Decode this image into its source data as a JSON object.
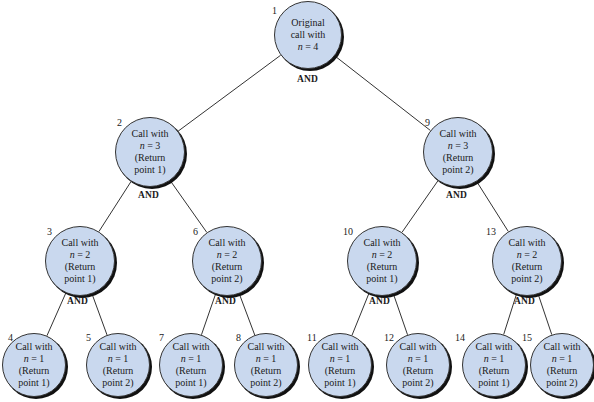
{
  "diagram": {
    "type": "recursion-tree",
    "and_label": "AND",
    "nodes": [
      {
        "id": 1,
        "lines": [
          "Original",
          "call with",
          "n = 4"
        ],
        "cx": 308,
        "cy": 35,
        "r": 34,
        "num_x": 272,
        "num_y": 5,
        "parent": null
      },
      {
        "id": 2,
        "lines": [
          "Call with",
          "n = 3",
          "(Return",
          "point 1)"
        ],
        "cx": 150,
        "cy": 152,
        "r": 35,
        "num_x": 117,
        "num_y": 117,
        "parent": 1
      },
      {
        "id": 9,
        "lines": [
          "Call with",
          "n = 3",
          "(Return",
          "point 2)"
        ],
        "cx": 458,
        "cy": 152,
        "r": 35,
        "num_x": 425,
        "num_y": 117,
        "parent": 1
      },
      {
        "id": 3,
        "lines": [
          "Call with",
          "n = 2",
          "(Return",
          "point 1)"
        ],
        "cx": 80,
        "cy": 261,
        "r": 35,
        "num_x": 47,
        "num_y": 226,
        "parent": 2
      },
      {
        "id": 6,
        "lines": [
          "Call with",
          "n = 2",
          "(Return",
          "point 2)"
        ],
        "cx": 227,
        "cy": 261,
        "r": 35,
        "num_x": 193,
        "num_y": 226,
        "parent": 2
      },
      {
        "id": 10,
        "lines": [
          "Call with",
          "n = 2",
          "(Return",
          "point 1)"
        ],
        "cx": 382,
        "cy": 261,
        "r": 35,
        "num_x": 343,
        "num_y": 226,
        "parent": 9
      },
      {
        "id": 13,
        "lines": [
          "Call with",
          "n = 2",
          "(Return",
          "point 2)"
        ],
        "cx": 527,
        "cy": 261,
        "r": 35,
        "num_x": 486,
        "num_y": 226,
        "parent": 9
      },
      {
        "id": 4,
        "lines": [
          "Call with",
          "n = 1",
          "(Return",
          "point 1)"
        ],
        "cx": 34,
        "cy": 365,
        "r": 32,
        "num_x": 8,
        "num_y": 332,
        "parent": 3
      },
      {
        "id": 5,
        "lines": [
          "Call with",
          "n = 1",
          "(Return",
          "point 2)"
        ],
        "cx": 118,
        "cy": 365,
        "r": 32,
        "num_x": 86,
        "num_y": 332,
        "parent": 3
      },
      {
        "id": 7,
        "lines": [
          "Call with",
          "n = 1",
          "(Return",
          "point 1)"
        ],
        "cx": 191,
        "cy": 365,
        "r": 32,
        "num_x": 159,
        "num_y": 332,
        "parent": 6
      },
      {
        "id": 8,
        "lines": [
          "Call with",
          "n = 1",
          "(Return",
          "point 2)"
        ],
        "cx": 266,
        "cy": 365,
        "r": 32,
        "num_x": 236,
        "num_y": 332,
        "parent": 6
      },
      {
        "id": 11,
        "lines": [
          "Call with",
          "n = 1",
          "(Return",
          "point 1)"
        ],
        "cx": 340,
        "cy": 365,
        "r": 32,
        "num_x": 307,
        "num_y": 332,
        "parent": 10
      },
      {
        "id": 12,
        "lines": [
          "Call with",
          "n = 1",
          "(Return",
          "point 2)"
        ],
        "cx": 418,
        "cy": 365,
        "r": 32,
        "num_x": 384,
        "num_y": 332,
        "parent": 10
      },
      {
        "id": 14,
        "lines": [
          "Call with",
          "n = 1",
          "(Return",
          "point 1)"
        ],
        "cx": 494,
        "cy": 365,
        "r": 32,
        "num_x": 455,
        "num_y": 332,
        "parent": 13
      },
      {
        "id": 15,
        "lines": [
          "Call with",
          "n = 1",
          "(Return",
          "point 2)"
        ],
        "cx": 562,
        "cy": 365,
        "r": 32,
        "num_x": 522,
        "num_y": 332,
        "parent": 13
      }
    ],
    "and_positions": [
      {
        "parent": 1,
        "x": 297,
        "y": 74
      },
      {
        "parent": 2,
        "x": 138,
        "y": 190
      },
      {
        "parent": 9,
        "x": 446,
        "y": 190
      },
      {
        "parent": 3,
        "x": 67,
        "y": 296
      },
      {
        "parent": 6,
        "x": 215,
        "y": 296
      },
      {
        "parent": 10,
        "x": 369,
        "y": 296
      },
      {
        "parent": 13,
        "x": 514,
        "y": 296
      }
    ],
    "colors": {
      "node_fill": "#c9d8ee",
      "node_border": "#333333",
      "edge": "#333333"
    }
  }
}
